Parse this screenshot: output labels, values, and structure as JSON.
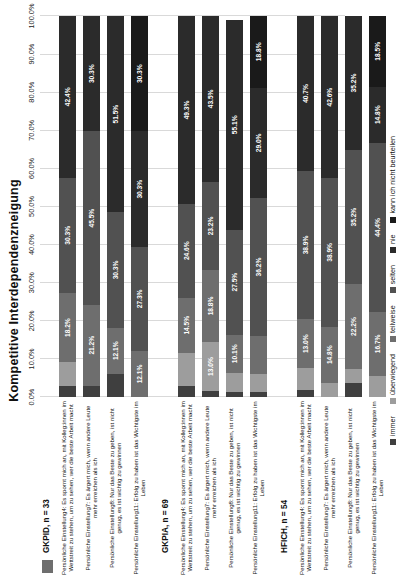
{
  "chart_data": {
    "type": "bar",
    "title": "Kompetitive Interdependenzneigung",
    "subtype": "100% stacked horizontal bar",
    "xlabel": "",
    "ylabel": "",
    "xlim": [
      0,
      100
    ],
    "grid": true,
    "legend_position": "bottom",
    "x_ticks": [
      "0.0%",
      "10.0%",
      "20.0%",
      "30.0%",
      "40.0%",
      "50.0%",
      "60.0%",
      "70.0%",
      "80.0%",
      "90.0%",
      "100.0%"
    ],
    "legend": [
      {
        "label": "immer",
        "color": "#3f3f3f"
      },
      {
        "label": "überwiegend",
        "color": "#9d9d9d"
      },
      {
        "label": "teilweise",
        "color": "#6e6e6e"
      },
      {
        "label": "selten",
        "color": "#515151"
      },
      {
        "label": "nie",
        "color": "#2b2b2b"
      },
      {
        "label": "kann ich nicht beurteilen",
        "color": "#1a1a1a"
      }
    ],
    "series": [
      {
        "name": "immer",
        "color": "#3f3f3f"
      },
      {
        "name": "überwiegend",
        "color": "#9d9d9d"
      },
      {
        "name": "teilweise",
        "color": "#6e6e6e"
      },
      {
        "name": "selten",
        "color": "#515151"
      },
      {
        "name": "nie",
        "color": "#2b2b2b"
      },
      {
        "name": "kann ich nicht beurteilen",
        "color": "#1a1a1a"
      }
    ],
    "groups": [
      {
        "name": "GKPID, n = 33",
        "marker": "bars1",
        "rows": [
          {
            "label": "Persönliche Einstellung4: Es spornt mich an, mit Kolleg:innen im Wettstreit zu stehen, um zu sehen, wer die beste Arbeit macht",
            "values": [
              3.0,
              6.1,
              18.2,
              30.3,
              42.4,
              0.0
            ],
            "labels": [
              "",
              "",
              "18.2%",
              "30.3%",
              "42.4%",
              ""
            ]
          },
          {
            "label": "Persönliche Einstellung7: Es ärgert mich, wenn andere Leute mehr erreichen als ich",
            "values": [
              3.0,
              0.0,
              21.2,
              45.5,
              30.3,
              0.0
            ],
            "labels": [
              "",
              "",
              "21.2%",
              "45.5%",
              "30.3%",
              ""
            ]
          },
          {
            "label": "Persönliche Einstellung8: Nur das Beste zu geben, ist nicht genug, es ist wichtig zu gewinnen",
            "values": [
              6.1,
              0.0,
              12.1,
              30.3,
              51.5,
              0.0
            ],
            "labels": [
              "",
              "",
              "12.1%",
              "30.3%",
              "51.5%",
              ""
            ]
          },
          {
            "label": "Persönliche Einstellung11: Erfolg zu haben ist das Wichtigste im Leben",
            "values": [
              0.0,
              0.0,
              12.1,
              27.3,
              30.3,
              30.3
            ],
            "labels": [
              "",
              "",
              "12.1%",
              "27.3%",
              "30.3%",
              "30.3%"
            ]
          }
        ]
      },
      {
        "name": "GKPIA, n = 69",
        "marker": "bars2",
        "rows": [
          {
            "label": "Persönliche Einstellung4: Es spornt mich an, mit Kolleg:innen im Wettstreit zu stehen, um zu sehen, wer die beste Arbeit macht",
            "values": [
              2.9,
              8.7,
              14.5,
              24.6,
              49.3,
              0.0
            ],
            "labels": [
              "",
              "",
              "14.5%",
              "24.6%",
              "49.3%",
              ""
            ]
          },
          {
            "label": "Persönliche Einstellung7: Es ärgert mich, wenn andere Leute mehr erreichen als ich",
            "values": [
              1.5,
              13.0,
              18.8,
              23.2,
              43.5,
              0.0
            ],
            "labels": [
              "",
              "13.0%",
              "18.8%",
              "23.2%",
              "43.5%",
              ""
            ]
          },
          {
            "label": "Persönliche Einstellung8: Nur das Beste zu geben, ist nicht genug, es ist wichtig zu gewinnen",
            "values": [
              1.4,
              4.9,
              10.1,
              27.5,
              55.1,
              0.0
            ],
            "labels": [
              "",
              "",
              "10.1%",
              "27.5%",
              "55.1%",
              ""
            ]
          },
          {
            "label": "Persönliche Einstellung11: Erfolg zu haben ist das Wichtigste im Leben",
            "values": [
              1.4,
              4.6,
              10.0,
              36.2,
              29.0,
              18.8
            ],
            "labels": [
              "",
              "",
              "",
              "36.2%",
              "29.0%",
              "18.8%"
            ]
          }
        ]
      },
      {
        "name": "HFICH, n = 54",
        "marker": "cross",
        "rows": [
          {
            "label": "Persönliche Einstellung4: Es spornt mich an, mit Kolleg:innen im Wettstreit zu stehen, um zu sehen, wer die beste Arbeit macht",
            "values": [
              1.9,
              5.6,
              13.0,
              38.9,
              40.7,
              0.0
            ],
            "labels": [
              "",
              "",
              "13.0%",
              "38.9%",
              "40.7%",
              ""
            ]
          },
          {
            "label": "Persönliche Einstellung7: Es ärgert mich, wenn andere Leute mehr erreichen als ich",
            "values": [
              0.0,
              3.7,
              14.8,
              38.9,
              42.6,
              0.0
            ],
            "labels": [
              "",
              "",
              "14.8%",
              "38.9%",
              "42.6%",
              ""
            ]
          },
          {
            "label": "Persönliche Einstellung8: Nur das Beste zu geben, ist nicht genug, es ist wichtig zu gewinnen",
            "values": [
              3.7,
              3.7,
              22.2,
              35.2,
              35.2,
              0.0
            ],
            "labels": [
              "",
              "",
              "22.2%",
              "35.2%",
              "35.2%",
              ""
            ]
          },
          {
            "label": "Persönliche Einstellung11: Erfolg zu haben ist das Wichtigste im Leben",
            "values": [
              0.0,
              5.6,
              16.7,
              44.4,
              14.8,
              18.5
            ],
            "labels": [
              "",
              "",
              "16.7%",
              "44.4%",
              "14.8%",
              "18.5%"
            ]
          }
        ]
      }
    ]
  }
}
